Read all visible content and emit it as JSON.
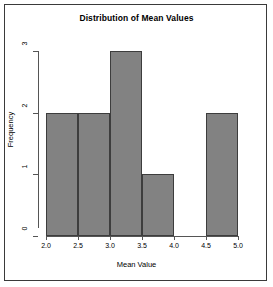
{
  "chart_data": {
    "type": "bar",
    "title": "Distribution of Mean Values",
    "xlabel": "Mean Value",
    "ylabel": "Frequency",
    "categories": [
      "2.0-2.5",
      "2.5-3.0",
      "3.0-3.5",
      "3.5-4.0",
      "4.0-4.5",
      "4.5-5.0"
    ],
    "bin_edges": [
      2.0,
      2.5,
      3.0,
      3.5,
      4.0,
      4.5,
      5.0
    ],
    "values": [
      2,
      2,
      3,
      1,
      0,
      2
    ],
    "xlim": [
      2.0,
      5.0
    ],
    "ylim": [
      0,
      3
    ],
    "xticks": [
      "2.0",
      "2.5",
      "3.0",
      "3.5",
      "4.0",
      "4.5",
      "5.0"
    ],
    "xtick_values": [
      2.0,
      2.5,
      3.0,
      3.5,
      4.0,
      4.5,
      5.0
    ],
    "yticks": [
      "0",
      "1",
      "2",
      "3"
    ],
    "ytick_values": [
      0,
      1,
      2,
      3
    ],
    "grid": false,
    "legend": false,
    "bar_fill_color": "#828282",
    "bar_border_color": "#3d3d3d",
    "axis_color": "#555555",
    "frame_color": "#3a3a3a",
    "background_color": "#ffffff"
  }
}
